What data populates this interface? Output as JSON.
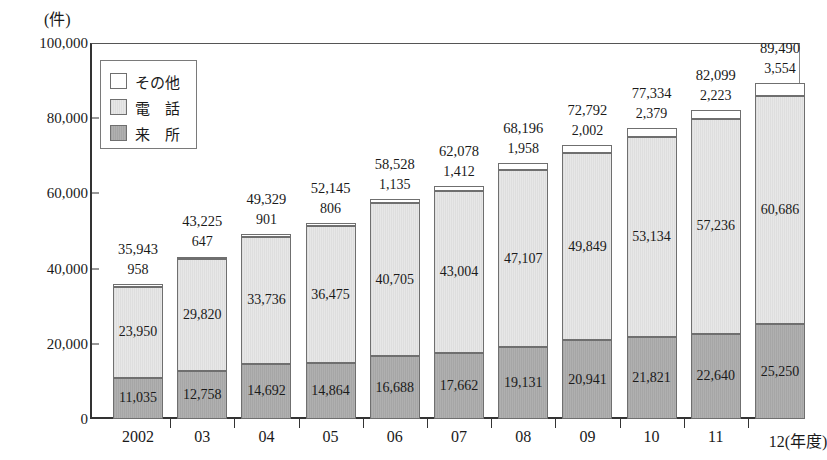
{
  "chart_data": {
    "type": "bar",
    "subtype": "stacked-bar",
    "title": "",
    "unit_label": "(件)",
    "xlabel": "(年度)",
    "ylabel": "",
    "ylim": [
      0,
      100000
    ],
    "ytick_labels": [
      "0",
      "20,000",
      "40,000",
      "60,000",
      "80,000",
      "100,000"
    ],
    "ytick_values": [
      0,
      20000,
      40000,
      60000,
      80000,
      100000
    ],
    "grid": false,
    "legend_position": "upper-left-inside",
    "categories": [
      "2002",
      "03",
      "04",
      "05",
      "06",
      "07",
      "08",
      "09",
      "10",
      "11",
      "12"
    ],
    "last_category_suffix": "(年度)",
    "series": [
      {
        "name": "来所",
        "key": "raisho",
        "color": "#ababab",
        "values": [
          11035,
          12758,
          14692,
          14864,
          16688,
          17662,
          19131,
          20941,
          21821,
          22640,
          25250
        ],
        "labels": [
          "11,035",
          "12,758",
          "14,692",
          "14,864",
          "16,688",
          "17,662",
          "19,131",
          "20,941",
          "21,821",
          "22,640",
          "25,250"
        ]
      },
      {
        "name": "電　話",
        "key": "denwa",
        "color": "#e2e2e2",
        "values": [
          23950,
          29820,
          33736,
          36475,
          40705,
          43004,
          47107,
          49849,
          53134,
          57236,
          60686
        ],
        "labels": [
          "23,950",
          "29,820",
          "33,736",
          "36,475",
          "40,705",
          "43,004",
          "47,107",
          "49,849",
          "53,134",
          "57,236",
          "60,686"
        ]
      },
      {
        "name": "その他",
        "key": "sonota",
        "color": "#ffffff",
        "values": [
          958,
          647,
          901,
          806,
          1135,
          1412,
          1958,
          2002,
          2379,
          2223,
          3554
        ],
        "labels": [
          "958",
          "647",
          "901",
          "806",
          "1,135",
          "1,412",
          "1,958",
          "2,002",
          "2,379",
          "2,223",
          "3,554"
        ]
      }
    ],
    "totals": [
      35943,
      43225,
      49329,
      52145,
      58528,
      62078,
      68196,
      72792,
      77334,
      82099,
      89490
    ],
    "total_labels": [
      "35,943",
      "43,225",
      "49,329",
      "52,145",
      "58,528",
      "62,078",
      "68,196",
      "72,792",
      "77,334",
      "82,099",
      "89,490"
    ]
  },
  "legend": {
    "items": [
      {
        "label": "その他",
        "swatch": "white"
      },
      {
        "label": "電　話",
        "swatch": "light-gray"
      },
      {
        "label": "来　所",
        "swatch": "dark-gray"
      }
    ]
  }
}
